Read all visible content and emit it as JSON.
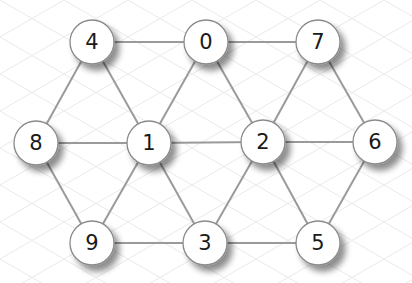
{
  "diagram": {
    "type": "undirected-graph",
    "colors": {
      "background": "#ffffff",
      "grid": "#e9e9e9",
      "edge": "#9a9a9a",
      "node_fill": "#ffffff",
      "node_stroke": "#8a8a8a",
      "label": "#1a1a1a"
    },
    "node_radius": 22,
    "nodes": [
      {
        "id": "0",
        "label": "0",
        "x": 206,
        "y": 42
      },
      {
        "id": "1",
        "label": "1",
        "x": 149,
        "y": 143
      },
      {
        "id": "2",
        "label": "2",
        "x": 263,
        "y": 142
      },
      {
        "id": "3",
        "label": "3",
        "x": 205,
        "y": 243
      },
      {
        "id": "4",
        "label": "4",
        "x": 92,
        "y": 42
      },
      {
        "id": "5",
        "label": "5",
        "x": 318,
        "y": 243
      },
      {
        "id": "6",
        "label": "6",
        "x": 375,
        "y": 142
      },
      {
        "id": "7",
        "label": "7",
        "x": 318,
        "y": 42
      },
      {
        "id": "8",
        "label": "8",
        "x": 36,
        "y": 143
      },
      {
        "id": "9",
        "label": "9",
        "x": 92,
        "y": 243
      }
    ],
    "edges": [
      [
        "4",
        "0"
      ],
      [
        "0",
        "7"
      ],
      [
        "4",
        "8"
      ],
      [
        "4",
        "1"
      ],
      [
        "0",
        "1"
      ],
      [
        "0",
        "2"
      ],
      [
        "7",
        "2"
      ],
      [
        "7",
        "6"
      ],
      [
        "8",
        "1"
      ],
      [
        "1",
        "2"
      ],
      [
        "2",
        "6"
      ],
      [
        "8",
        "9"
      ],
      [
        "1",
        "9"
      ],
      [
        "1",
        "3"
      ],
      [
        "2",
        "3"
      ],
      [
        "2",
        "5"
      ],
      [
        "6",
        "5"
      ],
      [
        "9",
        "3"
      ],
      [
        "3",
        "5"
      ]
    ]
  }
}
